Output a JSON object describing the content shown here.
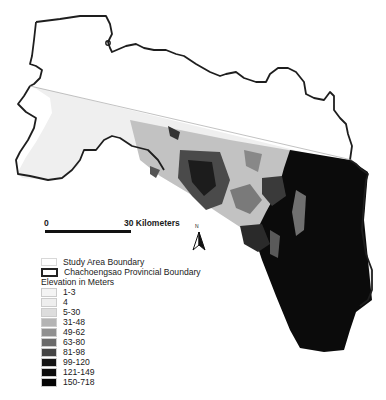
{
  "map": {
    "scale_bar": {
      "start_label": "0",
      "end_label": "30 Kilometers"
    },
    "north_arrow": {
      "label": "N"
    }
  },
  "legend": {
    "boundaries": [
      {
        "label": "Study Area Boundary",
        "style": "thin-light"
      },
      {
        "label": "Chachoengsao Provincial Boundary",
        "style": "thick-dark"
      }
    ],
    "elevation_title": "Elevation in Meters",
    "elevation_classes": [
      {
        "label": "1-3",
        "color": "#f4f4f4"
      },
      {
        "label": "4",
        "color": "#eeeeee"
      },
      {
        "label": "5-30",
        "color": "#dddddd"
      },
      {
        "label": "31-48",
        "color": "#b4b4b4"
      },
      {
        "label": "49-62",
        "color": "#909090"
      },
      {
        "label": "63-80",
        "color": "#6a6a6a"
      },
      {
        "label": "81-98",
        "color": "#444444"
      },
      {
        "label": "99-120",
        "color": "#141414"
      },
      {
        "label": "121-149",
        "color": "#0c0c0c"
      },
      {
        "label": "150-718",
        "color": "#050505"
      }
    ]
  }
}
